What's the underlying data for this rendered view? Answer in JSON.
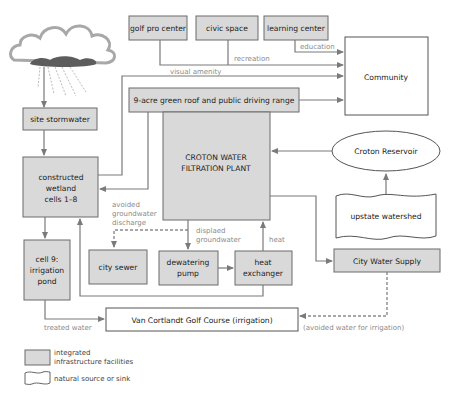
{
  "diagram": {
    "nodes": {
      "golf_pro_center": "golf pro center",
      "civic_space": "civic space",
      "learning_center": "learning center",
      "community": "Community",
      "green_roof": "9-acre green roof and public driving range",
      "site_stormwater": "site stormwater",
      "wetland": [
        "constructed",
        "wetland",
        "cells 1–8"
      ],
      "plant": [
        "CROTON WATER",
        "FILTRATION PLANT"
      ],
      "croton_reservoir": "Croton Reservoir",
      "upstate_watershed": "upstate watershed",
      "irrigation_pond": [
        "cell 9:",
        "irrigation",
        "pond"
      ],
      "city_sewer": "city sewer",
      "dewatering_pump": [
        "dewatering",
        "pump"
      ],
      "heat_exchanger": [
        "heat",
        "exchanger"
      ],
      "city_water_supply": "City Water Supply",
      "golf_course": "Van Cortlandt Golf Course (irrigation)"
    },
    "flow_labels": {
      "recreation": "recreation",
      "education": "education",
      "visual_amenity": "visual amenity",
      "avoided_discharge": [
        "avoided",
        "groundwater",
        "discharge"
      ],
      "displaced_groundwater": [
        "displaed",
        "groundwater"
      ],
      "heat": "heat",
      "treated_water": "treated water",
      "avoided_water": "(avoided water for irrigation)"
    },
    "legend": {
      "facilities": [
        "integrated",
        "infrastructure facilities"
      ],
      "natural": "natural source or sink"
    },
    "colors": {
      "facility_fill": "#d9d9d9",
      "line": "#7a7a7a"
    }
  }
}
